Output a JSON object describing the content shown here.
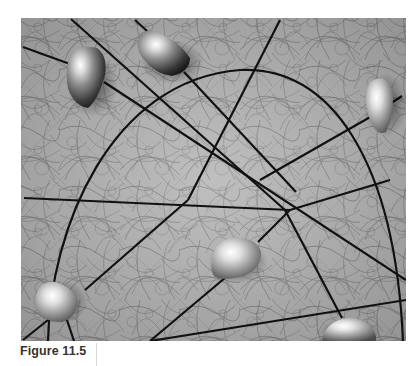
{
  "figure": {
    "caption": "Figure 11.5",
    "colors": {
      "background": "#a9a9a9",
      "texture": "#6f6f6f",
      "lines": "#111111",
      "page": "#ffffff"
    },
    "blob_count": 6
  }
}
